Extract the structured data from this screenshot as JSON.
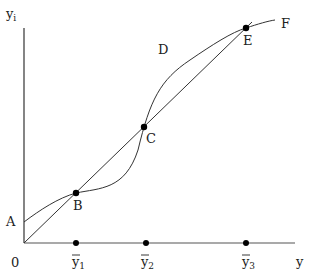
{
  "diagram": {
    "axes": {
      "y_label": "y",
      "y_label_sub": "i",
      "x_label": "y",
      "origin_label": "0"
    },
    "x_ticks": [
      {
        "label": "y",
        "sub": "1"
      },
      {
        "label": "y",
        "sub": "2"
      },
      {
        "label": "y",
        "sub": "3"
      }
    ],
    "points": {
      "A": "A",
      "B": "B",
      "C": "C",
      "D": "D",
      "E": "E",
      "F": "F"
    },
    "colors": {
      "line": "#333333",
      "dot": "#000000"
    }
  }
}
